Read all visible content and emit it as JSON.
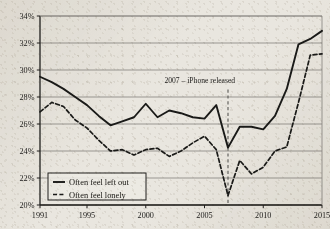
{
  "chart_data": {
    "type": "line",
    "title": "",
    "xlabel": "",
    "ylabel": "",
    "xlim": [
      1991,
      2015
    ],
    "ylim": [
      20,
      34
    ],
    "ytick_labels": [
      "20%",
      "22%",
      "24%",
      "26%",
      "28%",
      "30%",
      "32%",
      "34%"
    ],
    "ytick_values": [
      20,
      22,
      24,
      26,
      28,
      30,
      32,
      34
    ],
    "xtick_labels": [
      "1991",
      "1995",
      "2000",
      "2005",
      "2010",
      "2015"
    ],
    "xtick_values": [
      1991,
      1995,
      2000,
      2005,
      2010,
      2015
    ],
    "grid": "horizontal",
    "legend_position": "bottom-left",
    "x": [
      1991,
      1992,
      1993,
      1994,
      1995,
      1996,
      1997,
      1998,
      1999,
      2000,
      2001,
      2002,
      2003,
      2004,
      2005,
      2006,
      2007,
      2008,
      2009,
      2010,
      2011,
      2012,
      2013,
      2014,
      2015
    ],
    "series": [
      {
        "name": "Often feel left out",
        "style": "solid",
        "color": "#1a1a18",
        "values": [
          29.5,
          29.1,
          28.6,
          28.0,
          27.4,
          26.6,
          25.9,
          26.2,
          26.5,
          27.5,
          26.5,
          27.0,
          26.8,
          26.5,
          26.4,
          27.4,
          24.25,
          25.8,
          25.8,
          25.6,
          26.6,
          28.6,
          31.9,
          32.3,
          32.9
        ]
      },
      {
        "name": "Often feel lonely",
        "style": "dashed",
        "color": "#1a1a18",
        "values": [
          26.9,
          27.6,
          27.3,
          26.3,
          25.7,
          24.8,
          24.0,
          24.1,
          23.7,
          24.1,
          24.2,
          23.6,
          24.0,
          24.6,
          25.1,
          24.1,
          20.7,
          23.3,
          22.3,
          22.8,
          24.0,
          24.3,
          27.6,
          31.1,
          31.2
        ]
      }
    ],
    "annotations": [
      {
        "name": "iphone-release",
        "text": "2007 – iPhone released",
        "x": 2007,
        "text_x": 2004.6,
        "text_y": 29.05,
        "line_style": "dashed",
        "line_top": 28.55,
        "line_bottom": 20.0
      }
    ]
  },
  "legend": {
    "items": [
      {
        "label": "Often feel left out",
        "style": "solid"
      },
      {
        "label": "Often feel lonely",
        "style": "dashed"
      }
    ]
  }
}
